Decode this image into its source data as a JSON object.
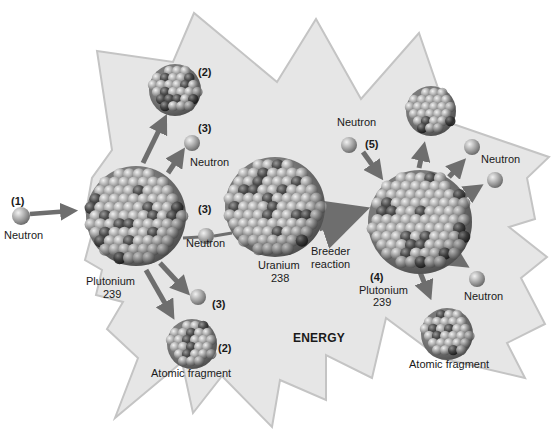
{
  "diagram": {
    "title": "",
    "background_shape": "starburst (energy release)",
    "colors": {
      "starburst_fill": "#e6e6e6",
      "starburst_stroke": "#c4c4c4",
      "arrow": "#6e6e6e",
      "neutron": "#a8a8a8",
      "nucleon_light": "#b9b9b9",
      "nucleon_dark": "#4a4a4a",
      "text": "#1a1a1a"
    },
    "energy_label": "ENERGY",
    "labels": {
      "step1_num": "(1)",
      "step1_neutron": "Neutron",
      "pu239_left_name": "Plutonium",
      "pu239_left_mass": "239",
      "frag_top_num": "(2)",
      "neutron_top_num": "(3)",
      "neutron_top": "Neutron",
      "neutron_mid_num": "(3)",
      "neutron_mid": "Neutron",
      "neutron_low_num": "(3)",
      "frag_bottom_num": "(2)",
      "frag_bottom": "Atomic fragment",
      "u238_name": "Uranium",
      "u238_mass": "238",
      "breeder_line1": "Breeder",
      "breeder_line2": "reaction",
      "neutron_in_right": "Neutron",
      "neutron_in_right_num": "(5)",
      "pu239_right_num": "(4)",
      "pu239_right_name": "Plutonium",
      "pu239_right_mass": "239",
      "neutron_right_top": "Neutron",
      "neutron_right_bottom": "Neutron",
      "frag_right": "Atomic fragment"
    },
    "nodes": [
      {
        "id": "neutron-1",
        "type": "neutron",
        "label": "Neutron",
        "step": "(1)"
      },
      {
        "id": "plutonium-239-left",
        "type": "nucleus",
        "label": "Plutonium 239"
      },
      {
        "id": "fragment-top-left",
        "type": "fragment",
        "step": "(2)"
      },
      {
        "id": "neutron-3a",
        "type": "neutron",
        "label": "Neutron",
        "step": "(3)"
      },
      {
        "id": "neutron-3b",
        "type": "neutron",
        "label": "Neutron",
        "step": "(3)"
      },
      {
        "id": "neutron-3c",
        "type": "neutron",
        "step": "(3)"
      },
      {
        "id": "fragment-bottom-left",
        "type": "fragment",
        "label": "Atomic fragment",
        "step": "(2)"
      },
      {
        "id": "uranium-238",
        "type": "nucleus",
        "label": "Uranium 238"
      },
      {
        "id": "neutron-5",
        "type": "neutron",
        "label": "Neutron",
        "step": "(5)"
      },
      {
        "id": "plutonium-239-right",
        "type": "nucleus",
        "label": "Plutonium 239",
        "step": "(4)"
      },
      {
        "id": "fragment-top-right",
        "type": "fragment"
      },
      {
        "id": "neutron-right-1",
        "type": "neutron",
        "label": "Neutron"
      },
      {
        "id": "neutron-right-2",
        "type": "neutron"
      },
      {
        "id": "neutron-right-3",
        "type": "neutron",
        "label": "Neutron"
      },
      {
        "id": "fragment-bottom-right",
        "type": "fragment",
        "label": "Atomic fragment"
      }
    ],
    "edges": [
      {
        "from": "neutron-1",
        "to": "plutonium-239-left"
      },
      {
        "from": "plutonium-239-left",
        "to": "fragment-top-left"
      },
      {
        "from": "plutonium-239-left",
        "to": "neutron-3a"
      },
      {
        "from": "plutonium-239-left",
        "to": "neutron-3b"
      },
      {
        "from": "neutron-3b",
        "to": "uranium-238"
      },
      {
        "from": "plutonium-239-left",
        "to": "neutron-3c"
      },
      {
        "from": "plutonium-239-left",
        "to": "fragment-bottom-left"
      },
      {
        "from": "uranium-238",
        "to": "plutonium-239-right",
        "label": "Breeder reaction"
      },
      {
        "from": "neutron-5",
        "to": "plutonium-239-right"
      },
      {
        "from": "plutonium-239-right",
        "to": "fragment-top-right"
      },
      {
        "from": "plutonium-239-right",
        "to": "neutron-right-1"
      },
      {
        "from": "plutonium-239-right",
        "to": "neutron-right-2"
      },
      {
        "from": "plutonium-239-right",
        "to": "neutron-right-3"
      },
      {
        "from": "plutonium-239-right",
        "to": "fragment-bottom-right"
      }
    ]
  }
}
